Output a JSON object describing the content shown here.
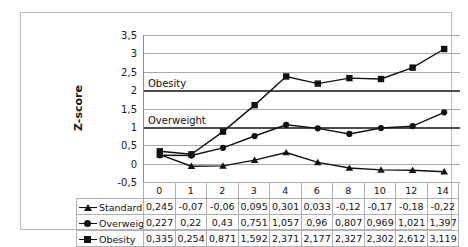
{
  "chart_data": {
    "type": "line",
    "title": "",
    "xlabel": "",
    "ylabel": "Z-score",
    "categories": [
      "0",
      "1",
      "2",
      "3",
      "4",
      "6",
      "8",
      "10",
      "12",
      "14"
    ],
    "ylim": [
      -0.5,
      3.5
    ],
    "ytick_step": 0.5,
    "ytick_labels": [
      "3,5",
      "3",
      "2,5",
      "2",
      "1,5",
      "1",
      "0,5",
      "0",
      "-0,5"
    ],
    "ytick_values": [
      3.5,
      3,
      2.5,
      2,
      1.5,
      1,
      0.5,
      0,
      -0.5
    ],
    "grid": true,
    "legend_position": "table-left",
    "annotations": [
      {
        "label": "Obesity",
        "y": 2
      },
      {
        "label": "Overweight",
        "y": 1
      }
    ],
    "series": [
      {
        "name": "Standard",
        "marker": "triangle",
        "values": [
          0.245,
          -0.07,
          -0.06,
          0.095,
          0.301,
          0.033,
          -0.12,
          -0.17,
          -0.18,
          -0.22
        ],
        "labels": [
          "0,245",
          "-0,07",
          "-0,06",
          "0,095",
          "0,301",
          "0,033",
          "-0,12",
          "-0,17",
          "-0,18",
          "-0,22"
        ]
      },
      {
        "name": "Overweight",
        "marker": "circle",
        "values": [
          0.227,
          0.22,
          0.43,
          0.751,
          1.057,
          0.96,
          0.807,
          0.969,
          1.021,
          1.397
        ],
        "labels": [
          "0,227",
          "0,22",
          "0,43",
          "0,751",
          "1,057",
          "0,96",
          "0,807",
          "0,969",
          "1,021",
          "1,397"
        ]
      },
      {
        "name": "Obesity",
        "marker": "square",
        "values": [
          0.335,
          0.254,
          0.871,
          1.592,
          2.371,
          2.177,
          2.327,
          2.302,
          2.612,
          3.119
        ],
        "labels": [
          "0,335",
          "0,254",
          "0,871",
          "1,592",
          "2,371",
          "2,177",
          "2,327",
          "2,302",
          "2,612",
          "3,119"
        ]
      }
    ],
    "colors": {
      "series_line": "#111111",
      "gridline": "#aaaaaa",
      "threshold_line": "#4d4d4d",
      "axis": "#8c8c8c",
      "frame": "#b9b9b9",
      "text": "#111111"
    }
  }
}
